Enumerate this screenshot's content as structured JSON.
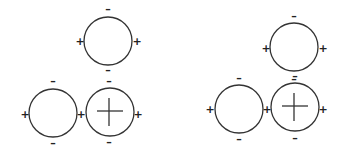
{
  "diagram": {
    "stroke_color": "#333333",
    "groups": [
      {
        "name": "left-arrangement",
        "circles": [
          {
            "id": "top",
            "cx": 108,
            "cy": 41,
            "r": 24,
            "cross": false,
            "signs": [
              {
                "t": "-",
                "x": 108,
                "y": 9
              },
              {
                "t": "-",
                "x": 108,
                "y": 70
              },
              {
                "t": "+",
                "x": 80,
                "y": 41
              },
              {
                "t": "+",
                "x": 137,
                "y": 41
              }
            ]
          },
          {
            "id": "bottom-left",
            "cx": 53,
            "cy": 113,
            "r": 24,
            "cross": false,
            "signs": [
              {
                "t": "-",
                "x": 53,
                "y": 81
              },
              {
                "t": "-",
                "x": 53,
                "y": 143
              },
              {
                "t": "+",
                "x": 25,
                "y": 114
              },
              {
                "t": "+",
                "x": 81,
                "y": 114
              }
            ]
          },
          {
            "id": "bottom-right",
            "cx": 110,
            "cy": 112,
            "r": 24,
            "cross": true,
            "signs": [
              {
                "t": "-",
                "x": 109,
                "y": 81
              },
              {
                "t": "-",
                "x": 109,
                "y": 142
              },
              {
                "t": "+",
                "x": 138,
                "y": 114
              }
            ]
          }
        ]
      },
      {
        "name": "right-arrangement",
        "circles": [
          {
            "id": "top",
            "cx": 294,
            "cy": 47,
            "r": 24,
            "cross": false,
            "signs": [
              {
                "t": "-",
                "x": 294,
                "y": 16
              },
              {
                "t": "-",
                "x": 294,
                "y": 79
              },
              {
                "t": "+",
                "x": 266,
                "y": 48
              },
              {
                "t": "+",
                "x": 323,
                "y": 48
              }
            ]
          },
          {
            "id": "bottom-left",
            "cx": 239,
            "cy": 109,
            "r": 24,
            "cross": false,
            "signs": [
              {
                "t": "-",
                "x": 239,
                "y": 78
              },
              {
                "t": "-",
                "x": 239,
                "y": 139
              },
              {
                "t": "+",
                "x": 210,
                "y": 109
              },
              {
                "t": "+",
                "x": 267,
                "y": 109
              }
            ]
          },
          {
            "id": "bottom-right",
            "cx": 295,
            "cy": 107,
            "r": 24,
            "cross": true,
            "signs": [
              {
                "t": "-",
                "x": 295,
                "y": 76
              },
              {
                "t": "-",
                "x": 295,
                "y": 138
              },
              {
                "t": "+",
                "x": 323,
                "y": 109
              }
            ]
          }
        ]
      }
    ]
  }
}
